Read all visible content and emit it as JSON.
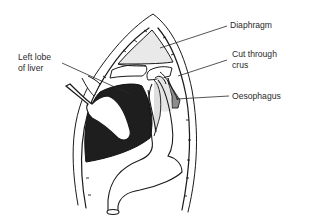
{
  "figure": {
    "type": "anatomical line drawing"
  },
  "labels": {
    "diaphragm": "Diaphragm",
    "cut_through_crus_line1": "Cut through",
    "cut_through_crus_line2": "crus",
    "oesophagus": "Oesophagus",
    "left_lobe_line1": "Left lobe",
    "left_lobe_line2": "of liver"
  },
  "colors": {
    "line": "#1a1a1a",
    "liver_fill": "#1e1e1e",
    "diaphragm_fill": "#e9e9e9",
    "oesophagus_fill": "#dedede",
    "background": "#ffffff"
  }
}
